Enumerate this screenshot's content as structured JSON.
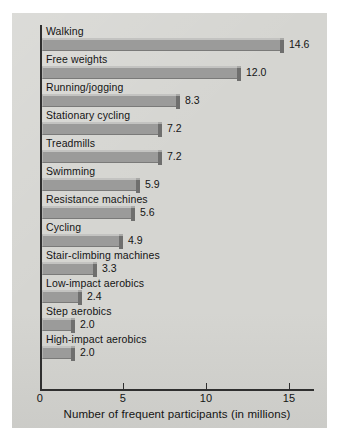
{
  "chart_data": {
    "type": "bar",
    "orientation": "horizontal",
    "title": "",
    "xlabel": "Number of frequent participants (in millions)",
    "ylabel": "",
    "xlim": [
      0,
      16.5
    ],
    "xticks": [
      0,
      5,
      10,
      15
    ],
    "xtick_labels": [
      "0",
      "5",
      "10",
      "15"
    ],
    "grid": false,
    "legend": null,
    "categories": [
      "Walking",
      "Free weights",
      "Running/jogging",
      "Stationary cycling",
      "Treadmills",
      "Swimming",
      "Resistance machines",
      "Cycling",
      "Stair-climbing machines",
      "Low-impact aerobics",
      "Step aerobics",
      "High-impact aerobics"
    ],
    "values": [
      14.6,
      12.0,
      8.3,
      7.2,
      7.2,
      5.9,
      5.6,
      4.9,
      3.3,
      2.4,
      2.0,
      2.0
    ],
    "value_labels": [
      "14.6",
      "12.0",
      "8.3",
      "7.2",
      "7.2",
      "5.9",
      "5.6",
      "4.9",
      "3.3",
      "2.4",
      "2.0",
      "2.0"
    ],
    "colors": {
      "panel_background": "#d5d5d1",
      "page_background": "#ffffff",
      "bar_fill": "#9b9b9a",
      "bar_highlight": "#c3c3c1",
      "bar_shadow": "#6f6f6e",
      "axis": "#2f2f2f",
      "text": "#141414"
    }
  }
}
